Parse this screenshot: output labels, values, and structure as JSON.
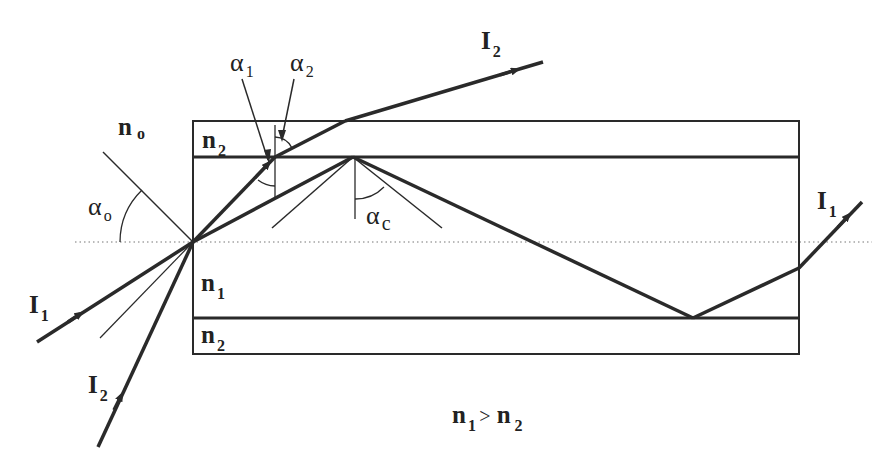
{
  "diagram": {
    "labels": {
      "n0": {
        "base": "n",
        "sub": "o"
      },
      "n1_core": {
        "base": "n",
        "sub": "1"
      },
      "n2_top": {
        "base": "n",
        "sub": "2"
      },
      "n2_bottom": {
        "base": "n",
        "sub": "2"
      },
      "alpha0": {
        "base": "α",
        "sub": "o"
      },
      "alpha1": {
        "base": "α",
        "sub": "1"
      },
      "alpha2": {
        "base": "α",
        "sub": "2"
      },
      "alphac": {
        "base": "α",
        "sub": "c"
      },
      "I1_in": {
        "base": "I",
        "sub": "1"
      },
      "I2_in": {
        "base": "I",
        "sub": "2"
      },
      "I1_out": {
        "base": "I",
        "sub": "1"
      },
      "I2_out": {
        "base": "I",
        "sub": "2"
      },
      "condition": {
        "left": "n",
        "left_sub": "1",
        "op": ">",
        "right": "n",
        "right_sub": "2"
      }
    },
    "colors": {
      "line": "#2a2a2a",
      "axis": "#777777",
      "background": "#ffffff"
    }
  }
}
